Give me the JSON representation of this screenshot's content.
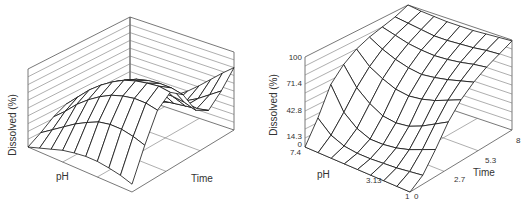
{
  "figure": {
    "title_cropped": "Dissolution surface of drug vs. pH and time"
  },
  "chart_data": [
    {
      "type": "surface3d",
      "title": "",
      "xlabel": "pH",
      "ylabel": "Time",
      "zlabel": "Dissolved (%)",
      "x_ticks": [],
      "y_ticks": [],
      "z_ticks": [],
      "grid": true,
      "grid_lines_back_walls": 10,
      "description": "Saddle-like surface: high dissolution along a ridge at low time near high pH, dropping to a trough, then rising sharply at the far time end near low pH",
      "z": [
        [
          0.0,
          0.1,
          0.22,
          0.3,
          0.28,
          0.18,
          0.08,
          0.02,
          0.0
        ],
        [
          0.05,
          0.2,
          0.35,
          0.45,
          0.42,
          0.3,
          0.15,
          0.05,
          0.02
        ],
        [
          0.1,
          0.3,
          0.5,
          0.6,
          0.55,
          0.4,
          0.22,
          0.1,
          0.06
        ],
        [
          0.15,
          0.4,
          0.62,
          0.72,
          0.66,
          0.48,
          0.28,
          0.15,
          0.12
        ],
        [
          0.18,
          0.48,
          0.72,
          0.82,
          0.75,
          0.55,
          0.32,
          0.2,
          0.2
        ],
        [
          0.2,
          0.55,
          0.8,
          0.9,
          0.82,
          0.6,
          0.36,
          0.25,
          0.3
        ],
        [
          0.2,
          0.58,
          0.85,
          0.95,
          0.86,
          0.62,
          0.38,
          0.32,
          0.42
        ],
        [
          0.18,
          0.58,
          0.88,
          0.98,
          0.88,
          0.62,
          0.4,
          0.4,
          0.55
        ],
        [
          0.15,
          0.55,
          0.88,
          1.0,
          0.88,
          0.6,
          0.42,
          0.5,
          0.68
        ],
        [
          0.1,
          0.5,
          0.85,
          0.98,
          0.85,
          0.55,
          0.45,
          0.6,
          0.8
        ]
      ]
    },
    {
      "type": "surface3d",
      "title": "",
      "xlabel": "pH",
      "ylabel": "Time",
      "zlabel": "Dissolved (%)",
      "x_ticks": [
        "7.4",
        "3.13",
        "1"
      ],
      "y_ticks": [
        "0",
        "2.7",
        "5.3",
        "8"
      ],
      "z_ticks": [
        "0",
        "14.3",
        "42.8",
        "71.4",
        "100"
      ],
      "zlim": [
        0,
        100
      ],
      "grid": true,
      "description": "Dissolution rises with time toward 100% at all pH; plateau highest at late time, with a dip at mid pH early on",
      "z": [
        [
          0,
          25,
          55,
          70,
          80,
          86,
          90,
          94,
          100
        ],
        [
          0,
          12,
          30,
          50,
          66,
          78,
          86,
          92,
          98
        ],
        [
          0,
          6,
          18,
          38,
          58,
          72,
          82,
          90,
          97
        ],
        [
          0,
          4,
          12,
          30,
          52,
          68,
          80,
          88,
          96
        ],
        [
          0,
          4,
          12,
          28,
          50,
          66,
          79,
          88,
          96
        ],
        [
          0,
          5,
          14,
          30,
          52,
          68,
          80,
          89,
          96
        ],
        [
          0,
          6,
          18,
          36,
          56,
          71,
          82,
          90,
          97
        ],
        [
          0,
          8,
          24,
          44,
          62,
          75,
          85,
          92,
          98
        ],
        [
          0,
          10,
          30,
          52,
          68,
          79,
          87,
          93,
          99
        ]
      ]
    }
  ],
  "charts": [
    {
      "zlabel": "Dissolved (%)",
      "xlabel": "pH",
      "ylabel": "Time"
    },
    {
      "zlabel": "Dissolved (%)",
      "xlabel": "pH",
      "ylabel": "Time",
      "z_ticks": [
        "100",
        "71.4",
        "42.8",
        "14.3",
        "0"
      ],
      "x_ticks": [
        "7.4",
        "3.13",
        "1"
      ],
      "y_ticks": [
        "0",
        "2.7",
        "5.3",
        "8"
      ]
    }
  ]
}
